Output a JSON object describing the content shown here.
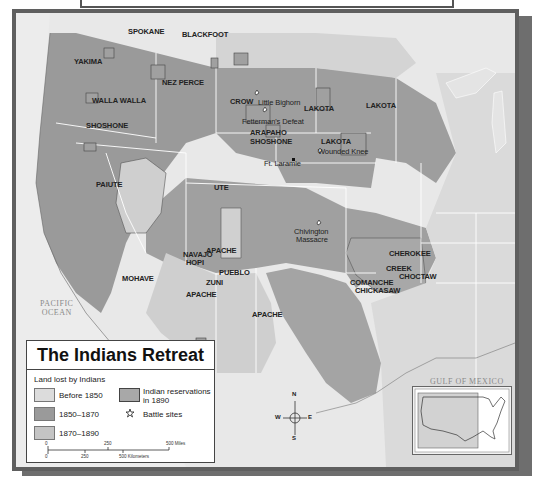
{
  "map": {
    "title": "The Indians Retreat",
    "water_labels": {
      "pacific_line1": "PACIFIC",
      "pacific_line2": "OCEAN",
      "gulf": "GULF OF MEXICO"
    },
    "tribe_labels": {
      "spokane": "SPOKANE",
      "blackfoot": "BLACKFOOT",
      "yakima": "YAKIMA",
      "nez_perce": "NEZ PERCE",
      "walla_walla": "WALLA WALLA",
      "crow": "CROW",
      "shoshone": "SHOSHONE",
      "arapaho": "ARAPAHO",
      "shoshone2": "SHOSHONE",
      "lakota1": "LAKOTA",
      "lakota2": "LAKOTA",
      "lakota3": "LAKOTA",
      "paiute": "PAIUTE",
      "ute": "UTE",
      "navajo": "NAVAJO",
      "hopi": "HOPI",
      "apache1": "APACHE",
      "apache2": "APACHE",
      "apache3": "APACHE",
      "mohave": "MOHAVE",
      "zuni": "ZUNI",
      "pueblo": "PUEBLO",
      "cherokee": "CHEROKEE",
      "creek": "CREEK",
      "choctaw": "CHOCTAW",
      "comanche": "COMANCHE",
      "chickasaw": "CHICKASAW"
    },
    "site_labels": {
      "little_bighorn": "Little Bighorn",
      "fettermans_defeat": "Fetterman's Defeat",
      "ft_laramie": "Ft. Laramie",
      "wounded_knee": "Wounded Knee",
      "chivington_line1": "Chivington",
      "chivington_line2": "Massacre"
    },
    "colors": {
      "before_1850": "#dcdcdc",
      "y1850_1870": "#9a9a9a",
      "y1870_1890": "#c4c4c4",
      "reservations_1890": "#a8a8a8",
      "frame": "#5f5f5f",
      "background": "#e6e6e6"
    }
  },
  "legend": {
    "subtitle": "Land lost by Indians",
    "items": [
      {
        "label": "Before 1850"
      },
      {
        "label": "1850–1870"
      },
      {
        "label": "1870–1890"
      },
      {
        "label_line1": "Indian reservations",
        "label_line2": "in 1890"
      },
      {
        "label": "Battle sites",
        "icon": "battle-star-icon"
      }
    ],
    "scale": {
      "miles_ticks": [
        "0",
        "250",
        "500 Miles"
      ],
      "km_ticks": [
        "0",
        "250",
        "500 Kilometers"
      ]
    }
  },
  "compass": {
    "n": "N",
    "s": "S",
    "e": "E",
    "w": "W"
  }
}
